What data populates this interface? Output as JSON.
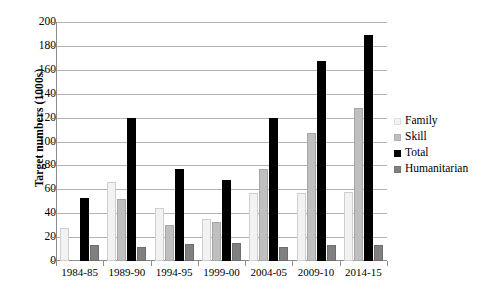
{
  "chart_data": {
    "type": "bar",
    "title": "",
    "xlabel": "",
    "ylabel": "Target numbers (1000s)",
    "ylim": [
      0,
      200
    ],
    "ytick_step": 20,
    "yticks": [
      200,
      180,
      160,
      140,
      120,
      100,
      80,
      60,
      40,
      20,
      0
    ],
    "grid": true,
    "legend_position": "right",
    "categories": [
      "1984-85",
      "1989-90",
      "1994-95",
      "1999-00",
      "2004-05",
      "2009-10",
      "2014-15"
    ],
    "series": [
      {
        "name": "Family",
        "color": "#f2f2f2",
        "values": [
          28,
          66,
          44,
          35,
          57,
          57,
          58
        ]
      },
      {
        "name": "Skill",
        "color": "#bfbfbf",
        "values": [
          0,
          52,
          30,
          33,
          77,
          107,
          128
        ]
      },
      {
        "name": "Total",
        "color": "#000000",
        "values": [
          53,
          120,
          77,
          68,
          120,
          167,
          189
        ]
      },
      {
        "name": "Humanitarian",
        "color": "#808080",
        "values": [
          13,
          12,
          14,
          15,
          12,
          13,
          13
        ]
      }
    ]
  },
  "legend": {
    "items": [
      {
        "label": "Family"
      },
      {
        "label": "Skill"
      },
      {
        "label": "Total"
      },
      {
        "label": "Humanitarian"
      }
    ]
  },
  "colors": {
    "family": "#f2f2f2",
    "skill": "#bfbfbf",
    "total": "#000000",
    "humanitarian": "#808080",
    "gridline": "#b3b3b3",
    "axis": "#8c8c8c",
    "text": "#000000"
  }
}
